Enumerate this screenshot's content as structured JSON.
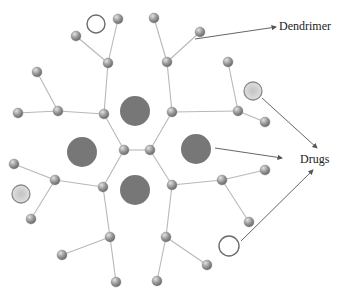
{
  "diagram": {
    "type": "dendrimer drug-delivery schematic",
    "labels": {
      "dendrimer": "Dendrimer",
      "drugs": "Drugs"
    },
    "colors": {
      "background": "#ffffff",
      "bond": "#b8b8b8",
      "node_light": "#c9c9c9",
      "node_dark": "#7a7a7a",
      "core_drug": "#777777",
      "surface_drug_fill": "#d4d4d4",
      "surface_drug_stroke": "#8a8a8a",
      "empty_marker_stroke": "#6b6b6b",
      "arrow": "#555555",
      "text": "#222222"
    },
    "core_nodes": [
      [
        124,
        150
      ],
      [
        150,
        150
      ]
    ],
    "generation1_nodes": [
      [
        104,
        114
      ],
      [
        172,
        112
      ],
      [
        103,
        187
      ],
      [
        172,
        185
      ]
    ],
    "generation2_nodes": [
      [
        108,
        63
      ],
      [
        58,
        111
      ],
      [
        167,
        62
      ],
      [
        238,
        111
      ],
      [
        55,
        180
      ],
      [
        110,
        237
      ],
      [
        222,
        180
      ],
      [
        166,
        237
      ]
    ],
    "terminal_nodes": [
      [
        118,
        19
      ],
      [
        76,
        36
      ],
      [
        37,
        72
      ],
      [
        18,
        113
      ],
      [
        154,
        18
      ],
      [
        200,
        32
      ],
      [
        228,
        62
      ],
      [
        265,
        122
      ],
      [
        14,
        164
      ],
      [
        31,
        219
      ],
      [
        62,
        255
      ],
      [
        116,
        282
      ],
      [
        265,
        170
      ],
      [
        249,
        222
      ],
      [
        207,
        265
      ],
      [
        157,
        281
      ]
    ],
    "bonds": [
      [
        [
          124,
          150
        ],
        [
          150,
          150
        ]
      ],
      [
        [
          124,
          150
        ],
        [
          104,
          114
        ]
      ],
      [
        [
          124,
          150
        ],
        [
          103,
          187
        ]
      ],
      [
        [
          150,
          150
        ],
        [
          172,
          112
        ]
      ],
      [
        [
          150,
          150
        ],
        [
          172,
          185
        ]
      ],
      [
        [
          104,
          114
        ],
        [
          108,
          63
        ]
      ],
      [
        [
          104,
          114
        ],
        [
          58,
          111
        ]
      ],
      [
        [
          108,
          63
        ],
        [
          118,
          19
        ]
      ],
      [
        [
          108,
          63
        ],
        [
          76,
          36
        ]
      ],
      [
        [
          58,
          111
        ],
        [
          37,
          72
        ]
      ],
      [
        [
          58,
          111
        ],
        [
          18,
          113
        ]
      ],
      [
        [
          172,
          112
        ],
        [
          167,
          62
        ]
      ],
      [
        [
          172,
          112
        ],
        [
          238,
          111
        ]
      ],
      [
        [
          167,
          62
        ],
        [
          154,
          18
        ]
      ],
      [
        [
          167,
          62
        ],
        [
          200,
          32
        ]
      ],
      [
        [
          238,
          111
        ],
        [
          228,
          62
        ]
      ],
      [
        [
          238,
          111
        ],
        [
          265,
          122
        ]
      ],
      [
        [
          103,
          187
        ],
        [
          55,
          180
        ]
      ],
      [
        [
          103,
          187
        ],
        [
          110,
          237
        ]
      ],
      [
        [
          55,
          180
        ],
        [
          14,
          164
        ]
      ],
      [
        [
          55,
          180
        ],
        [
          31,
          219
        ]
      ],
      [
        [
          110,
          237
        ],
        [
          62,
          255
        ]
      ],
      [
        [
          110,
          237
        ],
        [
          116,
          282
        ]
      ],
      [
        [
          172,
          185
        ],
        [
          222,
          180
        ]
      ],
      [
        [
          172,
          185
        ],
        [
          166,
          237
        ]
      ],
      [
        [
          222,
          180
        ],
        [
          265,
          170
        ]
      ],
      [
        [
          222,
          180
        ],
        [
          249,
          222
        ]
      ],
      [
        [
          166,
          237
        ],
        [
          207,
          265
        ]
      ],
      [
        [
          166,
          237
        ],
        [
          157,
          281
        ]
      ]
    ],
    "encapsulated_drugs": [
      {
        "cx": 135,
        "cy": 111,
        "r": 15
      },
      {
        "cx": 82,
        "cy": 152,
        "r": 15
      },
      {
        "cx": 196,
        "cy": 149,
        "r": 15
      },
      {
        "cx": 135,
        "cy": 190,
        "r": 15
      }
    ],
    "surface_drugs_filled": [
      {
        "cx": 21,
        "cy": 194,
        "r": 9
      },
      {
        "cx": 253,
        "cy": 91,
        "r": 9
      }
    ],
    "surface_drugs_empty": [
      {
        "cx": 96,
        "cy": 24,
        "r": 9
      },
      {
        "cx": 229,
        "cy": 246,
        "r": 10
      }
    ],
    "arrows": [
      {
        "name": "arrow-to-dendrimer-label",
        "from": [
          195,
          39
        ],
        "to": [
          276,
          27
        ]
      },
      {
        "name": "arrow-core-drug-to-drugs",
        "from": [
          215,
          148
        ],
        "to": [
          282,
          158
        ]
      },
      {
        "name": "arrow-surface-drug-to-drugs",
        "from": [
          262,
          98
        ],
        "to": [
          317,
          148
        ]
      },
      {
        "name": "arrow-empty-marker-to-drugs",
        "from": [
          241,
          241
        ],
        "to": [
          313,
          170
        ]
      }
    ],
    "label_positions": {
      "dendrimer": {
        "left": 279,
        "top": 20
      },
      "drugs": {
        "left": 300,
        "top": 153
      }
    }
  }
}
